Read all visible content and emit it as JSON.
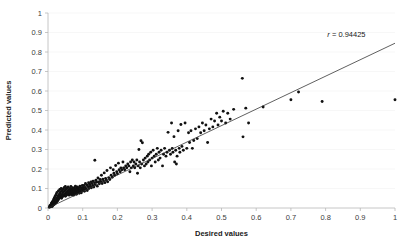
{
  "chart_data": {
    "type": "scatter",
    "title": "",
    "xlabel": "Desired values",
    "ylabel": "Predicted values",
    "xlim": [
      0,
      1
    ],
    "ylim": [
      0,
      1
    ],
    "xticks": [
      "0",
      "0.1",
      "0.2",
      "0.3",
      "0.4",
      "0.5",
      "0.6",
      "0.7",
      "0.8",
      "0.9",
      "1"
    ],
    "yticks": [
      "0",
      "0.1",
      "0.2",
      "0.3",
      "0.4",
      "0.5",
      "0.6",
      "0.7",
      "0.8",
      "0.9",
      "1"
    ],
    "grid": "horizontal-faint",
    "legend": "none",
    "annotations": [
      {
        "name": "correlation",
        "text": "r = 0.94425",
        "x": 0.86,
        "y": 0.875
      }
    ],
    "series": [
      {
        "name": "points",
        "marker": "filled-circle",
        "color": "#111111",
        "points": [
          [
            0.004,
            0.004
          ],
          [
            0.005,
            0.01
          ],
          [
            0.006,
            0.006
          ],
          [
            0.007,
            0.014
          ],
          [
            0.008,
            0.008
          ],
          [
            0.009,
            0.018
          ],
          [
            0.01,
            0.011
          ],
          [
            0.01,
            0.025
          ],
          [
            0.011,
            0.016
          ],
          [
            0.012,
            0.008
          ],
          [
            0.012,
            0.03
          ],
          [
            0.013,
            0.02
          ],
          [
            0.014,
            0.013
          ],
          [
            0.014,
            0.035
          ],
          [
            0.015,
            0.024
          ],
          [
            0.016,
            0.017
          ],
          [
            0.016,
            0.042
          ],
          [
            0.017,
            0.028
          ],
          [
            0.018,
            0.019
          ],
          [
            0.018,
            0.05
          ],
          [
            0.019,
            0.033
          ],
          [
            0.02,
            0.022
          ],
          [
            0.02,
            0.058
          ],
          [
            0.021,
            0.038
          ],
          [
            0.022,
            0.026
          ],
          [
            0.022,
            0.065
          ],
          [
            0.023,
            0.043
          ],
          [
            0.024,
            0.03
          ],
          [
            0.024,
            0.072
          ],
          [
            0.025,
            0.048
          ],
          [
            0.026,
            0.034
          ],
          [
            0.026,
            0.08
          ],
          [
            0.027,
            0.053
          ],
          [
            0.028,
            0.038
          ],
          [
            0.029,
            0.06
          ],
          [
            0.03,
            0.044
          ],
          [
            0.03,
            0.088
          ],
          [
            0.031,
            0.066
          ],
          [
            0.032,
            0.05
          ],
          [
            0.033,
            0.072
          ],
          [
            0.034,
            0.056
          ],
          [
            0.034,
            0.095
          ],
          [
            0.035,
            0.078
          ],
          [
            0.036,
            0.06
          ],
          [
            0.037,
            0.084
          ],
          [
            0.038,
            0.064
          ],
          [
            0.038,
            0.1
          ],
          [
            0.039,
            0.05
          ],
          [
            0.04,
            0.07
          ],
          [
            0.041,
            0.09
          ],
          [
            0.042,
            0.058
          ],
          [
            0.043,
            0.078
          ],
          [
            0.044,
            0.098
          ],
          [
            0.045,
            0.064
          ],
          [
            0.046,
            0.084
          ],
          [
            0.047,
            0.105
          ],
          [
            0.048,
            0.07
          ],
          [
            0.049,
            0.09
          ],
          [
            0.05,
            0.06
          ],
          [
            0.05,
            0.11
          ],
          [
            0.051,
            0.076
          ],
          [
            0.052,
            0.096
          ],
          [
            0.053,
            0.066
          ],
          [
            0.054,
            0.082
          ],
          [
            0.055,
            0.102
          ],
          [
            0.056,
            0.072
          ],
          [
            0.057,
            0.088
          ],
          [
            0.058,
            0.108
          ],
          [
            0.059,
            0.078
          ],
          [
            0.06,
            0.094
          ],
          [
            0.061,
            0.066
          ],
          [
            0.062,
            0.084
          ],
          [
            0.063,
            0.1
          ],
          [
            0.064,
            0.072
          ],
          [
            0.065,
            0.09
          ],
          [
            0.066,
            0.11
          ],
          [
            0.067,
            0.078
          ],
          [
            0.068,
            0.096
          ],
          [
            0.069,
            0.068
          ],
          [
            0.07,
            0.086
          ],
          [
            0.071,
            0.104
          ],
          [
            0.072,
            0.076
          ],
          [
            0.073,
            0.094
          ],
          [
            0.074,
            0.066
          ],
          [
            0.075,
            0.084
          ],
          [
            0.076,
            0.102
          ],
          [
            0.077,
            0.074
          ],
          [
            0.078,
            0.092
          ],
          [
            0.079,
            0.112
          ],
          [
            0.08,
            0.082
          ],
          [
            0.081,
            0.1
          ],
          [
            0.082,
            0.07
          ],
          [
            0.083,
            0.09
          ],
          [
            0.084,
            0.108
          ],
          [
            0.085,
            0.078
          ],
          [
            0.086,
            0.096
          ],
          [
            0.088,
            0.086
          ],
          [
            0.089,
            0.104
          ],
          [
            0.09,
            0.076
          ],
          [
            0.091,
            0.094
          ],
          [
            0.092,
            0.112
          ],
          [
            0.094,
            0.086
          ],
          [
            0.095,
            0.104
          ],
          [
            0.096,
            0.078
          ],
          [
            0.098,
            0.096
          ],
          [
            0.099,
            0.116
          ],
          [
            0.1,
            0.088
          ],
          [
            0.101,
            0.106
          ],
          [
            0.103,
            0.096
          ],
          [
            0.104,
            0.116
          ],
          [
            0.105,
            0.086
          ],
          [
            0.107,
            0.106
          ],
          [
            0.108,
            0.126
          ],
          [
            0.11,
            0.098
          ],
          [
            0.112,
            0.118
          ],
          [
            0.113,
            0.09
          ],
          [
            0.115,
            0.11
          ],
          [
            0.117,
            0.13
          ],
          [
            0.118,
            0.1
          ],
          [
            0.12,
            0.122
          ],
          [
            0.122,
            0.112
          ],
          [
            0.124,
            0.134
          ],
          [
            0.125,
            0.104
          ],
          [
            0.127,
            0.126
          ],
          [
            0.129,
            0.116
          ],
          [
            0.13,
            0.138
          ],
          [
            0.132,
            0.108
          ],
          [
            0.134,
            0.13
          ],
          [
            0.135,
            0.245
          ],
          [
            0.136,
            0.12
          ],
          [
            0.138,
            0.142
          ],
          [
            0.14,
            0.132
          ],
          [
            0.142,
            0.112
          ],
          [
            0.144,
            0.154
          ],
          [
            0.146,
            0.134
          ],
          [
            0.148,
            0.124
          ],
          [
            0.15,
            0.146
          ],
          [
            0.152,
            0.136
          ],
          [
            0.154,
            0.168
          ],
          [
            0.156,
            0.126
          ],
          [
            0.158,
            0.148
          ],
          [
            0.16,
            0.138
          ],
          [
            0.162,
            0.18
          ],
          [
            0.164,
            0.13
          ],
          [
            0.166,
            0.152
          ],
          [
            0.168,
            0.142
          ],
          [
            0.17,
            0.192
          ],
          [
            0.172,
            0.134
          ],
          [
            0.175,
            0.156
          ],
          [
            0.178,
            0.146
          ],
          [
            0.18,
            0.206
          ],
          [
            0.182,
            0.168
          ],
          [
            0.185,
            0.158
          ],
          [
            0.188,
            0.196
          ],
          [
            0.19,
            0.178
          ],
          [
            0.192,
            0.168
          ],
          [
            0.195,
            0.218
          ],
          [
            0.198,
            0.186
          ],
          [
            0.2,
            0.176
          ],
          [
            0.203,
            0.23
          ],
          [
            0.205,
            0.196
          ],
          [
            0.208,
            0.186
          ],
          [
            0.21,
            0.206
          ],
          [
            0.213,
            0.196
          ],
          [
            0.216,
            0.236
          ],
          [
            0.218,
            0.206
          ],
          [
            0.221,
            0.196
          ],
          [
            0.224,
            0.216
          ],
          [
            0.227,
            0.206
          ],
          [
            0.23,
            0.226
          ],
          [
            0.233,
            0.216
          ],
          [
            0.236,
            0.186
          ],
          [
            0.238,
            0.236
          ],
          [
            0.24,
            0.206
          ],
          [
            0.243,
            0.246
          ],
          [
            0.246,
            0.216
          ],
          [
            0.248,
            0.236
          ],
          [
            0.25,
            0.206
          ],
          [
            0.253,
            0.226
          ],
          [
            0.256,
            0.246
          ],
          [
            0.258,
            0.178
          ],
          [
            0.26,
            0.216
          ],
          [
            0.262,
            0.3
          ],
          [
            0.264,
            0.236
          ],
          [
            0.266,
            0.206
          ],
          [
            0.268,
            0.345
          ],
          [
            0.27,
            0.226
          ],
          [
            0.272,
            0.335
          ],
          [
            0.275,
            0.246
          ],
          [
            0.278,
            0.216
          ],
          [
            0.28,
            0.256
          ],
          [
            0.283,
            0.226
          ],
          [
            0.286,
            0.266
          ],
          [
            0.288,
            0.236
          ],
          [
            0.29,
            0.276
          ],
          [
            0.293,
            0.246
          ],
          [
            0.296,
            0.286
          ],
          [
            0.298,
            0.216
          ],
          [
            0.3,
            0.256
          ],
          [
            0.303,
            0.296
          ],
          [
            0.306,
            0.266
          ],
          [
            0.309,
            0.236
          ],
          [
            0.312,
            0.276
          ],
          [
            0.315,
            0.306
          ],
          [
            0.318,
            0.246
          ],
          [
            0.32,
            0.286
          ],
          [
            0.323,
            0.256
          ],
          [
            0.326,
            0.296
          ],
          [
            0.33,
            0.216
          ],
          [
            0.333,
            0.276
          ],
          [
            0.336,
            0.306
          ],
          [
            0.34,
            0.266
          ],
          [
            0.343,
            0.286
          ],
          [
            0.346,
            0.388
          ],
          [
            0.35,
            0.296
          ],
          [
            0.353,
            0.276
          ],
          [
            0.356,
            0.436
          ],
          [
            0.358,
            0.306
          ],
          [
            0.36,
            0.286
          ],
          [
            0.363,
            0.366
          ],
          [
            0.365,
            0.236
          ],
          [
            0.368,
            0.296
          ],
          [
            0.37,
            0.226
          ],
          [
            0.372,
            0.266
          ],
          [
            0.375,
            0.396
          ],
          [
            0.378,
            0.306
          ],
          [
            0.38,
            0.286
          ],
          [
            0.383,
            0.428
          ],
          [
            0.386,
            0.316
          ],
          [
            0.39,
            0.296
          ],
          [
            0.395,
            0.436
          ],
          [
            0.4,
            0.306
          ],
          [
            0.405,
            0.386
          ],
          [
            0.408,
            0.336
          ],
          [
            0.412,
            0.396
          ],
          [
            0.416,
            0.306
          ],
          [
            0.42,
            0.346
          ],
          [
            0.425,
            0.406
          ],
          [
            0.43,
            0.356
          ],
          [
            0.435,
            0.416
          ],
          [
            0.44,
            0.386
          ],
          [
            0.445,
            0.436
          ],
          [
            0.45,
            0.396
          ],
          [
            0.455,
            0.426
          ],
          [
            0.46,
            0.336
          ],
          [
            0.465,
            0.406
          ],
          [
            0.47,
            0.456
          ],
          [
            0.475,
            0.416
          ],
          [
            0.48,
            0.446
          ],
          [
            0.486,
            0.486
          ],
          [
            0.49,
            0.426
          ],
          [
            0.495,
            0.466
          ],
          [
            0.5,
            0.446
          ],
          [
            0.505,
            0.496
          ],
          [
            0.512,
            0.436
          ],
          [
            0.518,
            0.486
          ],
          [
            0.525,
            0.456
          ],
          [
            0.535,
            0.506
          ],
          [
            0.56,
            0.665
          ],
          [
            0.562,
            0.365
          ],
          [
            0.57,
            0.512
          ],
          [
            0.578,
            0.436
          ],
          [
            0.62,
            0.518
          ],
          [
            0.7,
            0.555
          ],
          [
            0.722,
            0.595
          ],
          [
            0.79,
            0.546
          ],
          [
            1.0,
            0.555
          ]
        ]
      }
    ],
    "fit_line": {
      "name": "linear-trend",
      "x0": 0.0,
      "y0": 0.0,
      "x1": 1.0,
      "y1": 0.845,
      "color": "#2b2b2b"
    }
  }
}
